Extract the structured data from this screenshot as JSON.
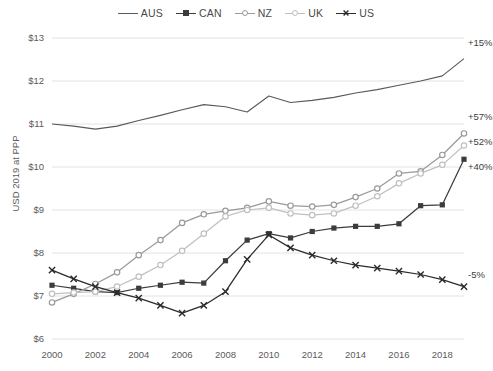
{
  "chart_data": {
    "type": "line",
    "title": "",
    "xlabel": "",
    "ylabel": "USD 2019 at PPP",
    "x": [
      2000,
      2001,
      2002,
      2003,
      2004,
      2005,
      2006,
      2007,
      2008,
      2009,
      2010,
      2011,
      2012,
      2013,
      2014,
      2015,
      2016,
      2017,
      2018,
      2019
    ],
    "xticks": [
      "2000",
      "2002",
      "2004",
      "2006",
      "2008",
      "2010",
      "2012",
      "2014",
      "2016",
      "2018"
    ],
    "yticks": [
      "$6",
      "$7",
      "$8",
      "$9",
      "$10",
      "$11",
      "$12",
      "$13"
    ],
    "ylim": [
      6,
      13
    ],
    "xlim": [
      2000,
      2019
    ],
    "grid": "horizontal",
    "legend_position": "top-center",
    "series": [
      {
        "name": "AUS",
        "color": "#595959",
        "marker": "none",
        "values": [
          11.0,
          10.95,
          10.88,
          10.95,
          11.08,
          11.2,
          11.33,
          11.45,
          11.4,
          11.28,
          11.65,
          11.5,
          11.55,
          11.62,
          11.72,
          11.8,
          11.9,
          12.0,
          12.12,
          12.52
        ],
        "end_label": "+15%"
      },
      {
        "name": "CAN",
        "color": "#3c3c3c",
        "marker": "square",
        "values": [
          7.25,
          7.18,
          7.1,
          7.08,
          7.18,
          7.25,
          7.32,
          7.3,
          7.82,
          8.3,
          8.45,
          8.35,
          8.5,
          8.58,
          8.62,
          8.62,
          8.68,
          9.1,
          9.12,
          10.18
        ],
        "end_label": "+40%"
      },
      {
        "name": "NZ",
        "color": "#9a9a9a",
        "marker": "circle",
        "values": [
          6.85,
          7.05,
          7.28,
          7.55,
          7.95,
          8.3,
          8.7,
          8.9,
          8.98,
          9.05,
          9.2,
          9.1,
          9.08,
          9.12,
          9.3,
          9.5,
          9.85,
          9.9,
          10.28,
          10.78
        ],
        "end_label": "+57%"
      },
      {
        "name": "UK",
        "color": "#c0c0c0",
        "marker": "circle",
        "values": [
          7.05,
          7.08,
          7.1,
          7.22,
          7.45,
          7.72,
          8.05,
          8.45,
          8.85,
          9.0,
          9.05,
          8.92,
          8.88,
          8.92,
          9.1,
          9.32,
          9.62,
          9.85,
          10.05,
          10.5
        ],
        "end_label": "+52%"
      },
      {
        "name": "US",
        "color": "#2b2b2b",
        "marker": "x",
        "values": [
          7.6,
          7.4,
          7.22,
          7.08,
          6.95,
          6.78,
          6.6,
          6.78,
          7.1,
          7.85,
          8.42,
          8.12,
          7.95,
          7.82,
          7.72,
          7.65,
          7.58,
          7.5,
          7.38,
          7.22
        ],
        "end_label": "-5%"
      }
    ]
  },
  "legend": {
    "items": [
      {
        "label": "AUS"
      },
      {
        "label": "CAN"
      },
      {
        "label": "NZ"
      },
      {
        "label": "UK"
      },
      {
        "label": "US"
      }
    ]
  }
}
